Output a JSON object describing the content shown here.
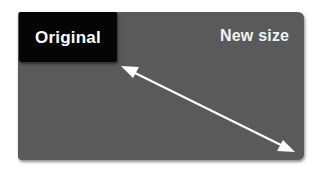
{
  "diagram": {
    "original_box": {
      "label": "Original",
      "color": "#050505"
    },
    "new_size_box": {
      "label": "New size",
      "color": "#5a5a5a"
    },
    "arrow": {
      "type": "double-headed",
      "color": "#ffffff",
      "from": [
        121,
        66
      ],
      "to": [
        295,
        152
      ]
    }
  }
}
